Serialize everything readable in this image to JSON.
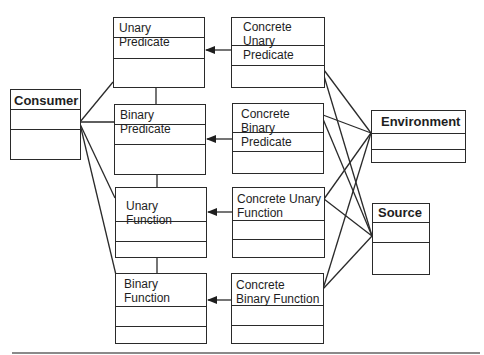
{
  "diagram": {
    "type": "uml-class-diagram",
    "classes": {
      "consumer": {
        "name": "Consumer"
      },
      "unary_predicate": {
        "name": "Unary Predicate"
      },
      "binary_predicate": {
        "name": "Binary Predicate"
      },
      "unary_function": {
        "name": "Unary Function"
      },
      "binary_function": {
        "name": "Binary Function"
      },
      "concrete_unary_predicate": {
        "name": "Concrete Unary Predicate"
      },
      "concrete_binary_predicate": {
        "name": "Concrete Binary Predicate"
      },
      "concrete_unary_function": {
        "name": "Concrete Unary Function"
      },
      "concrete_binary_function": {
        "name": "Concrete Binary Function"
      },
      "environment": {
        "name": "Environment"
      },
      "source": {
        "name": "Source"
      }
    },
    "relationships": [
      {
        "from": "Concrete Unary Predicate",
        "to": "Unary Predicate",
        "kind": "directed-arrow"
      },
      {
        "from": "Concrete Binary Predicate",
        "to": "Binary Predicate",
        "kind": "directed-arrow"
      },
      {
        "from": "Concrete Unary Function",
        "to": "Unary Function",
        "kind": "directed-arrow"
      },
      {
        "from": "Concrete Binary Function",
        "to": "Binary Function",
        "kind": "directed-arrow"
      },
      {
        "from": "Consumer",
        "to": "Unary Predicate",
        "kind": "association"
      },
      {
        "from": "Consumer",
        "to": "Binary Predicate",
        "kind": "association"
      },
      {
        "from": "Consumer",
        "to": "Unary Function",
        "kind": "association"
      },
      {
        "from": "Consumer",
        "to": "Binary Function",
        "kind": "association"
      },
      {
        "from": "Unary Predicate",
        "to": "Binary Predicate",
        "kind": "association"
      },
      {
        "from": "Binary Predicate",
        "to": "Unary Function",
        "kind": "association"
      },
      {
        "from": "Unary Function",
        "to": "Binary Function",
        "kind": "association"
      },
      {
        "from": "Concrete Unary Predicate",
        "to": "Environment",
        "kind": "association"
      },
      {
        "from": "Concrete Unary Predicate",
        "to": "Source",
        "kind": "association"
      },
      {
        "from": "Concrete Binary Predicate",
        "to": "Environment",
        "kind": "association"
      },
      {
        "from": "Concrete Binary Predicate",
        "to": "Source",
        "kind": "association"
      },
      {
        "from": "Concrete Unary Function",
        "to": "Environment",
        "kind": "association"
      },
      {
        "from": "Concrete Unary Function",
        "to": "Source",
        "kind": "association"
      },
      {
        "from": "Concrete Binary Function",
        "to": "Environment",
        "kind": "association"
      },
      {
        "from": "Concrete Binary Function",
        "to": "Source",
        "kind": "association"
      }
    ]
  },
  "colors": {
    "line": "#2a2a2a",
    "text": "#1e1e1e",
    "background": "#ffffff",
    "rule": "#8a8a8a"
  }
}
